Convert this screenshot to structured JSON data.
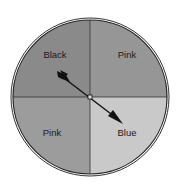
{
  "spinner": {
    "sections": [
      {
        "id": "top-left",
        "label": "Black",
        "fill": "#8a8a8a"
      },
      {
        "id": "top-right",
        "label": "Pink",
        "fill": "#969696"
      },
      {
        "id": "bottom-left",
        "label": "Pink",
        "fill": "#9c9c9c"
      },
      {
        "id": "bottom-right",
        "label": "Blue",
        "fill": "#c9c9c9"
      }
    ],
    "pointer": {
      "points_to": "Blue"
    }
  }
}
